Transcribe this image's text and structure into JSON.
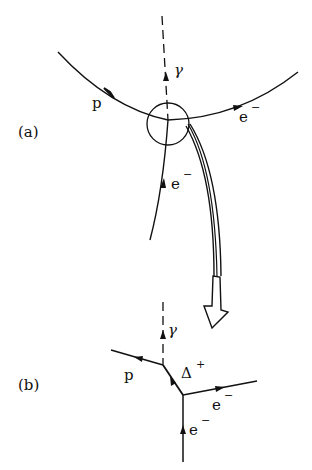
{
  "diagram": {
    "panel_a": {
      "label": "(a)",
      "particles": {
        "proton": "p",
        "photon": "γ",
        "electron_out": "e",
        "electron_out_sup": "−",
        "electron_in": "e",
        "electron_in_sup": "−"
      }
    },
    "panel_b": {
      "label": "(b)",
      "particles": {
        "proton": "p",
        "photon": "γ",
        "delta": "Δ",
        "delta_sup": "+",
        "electron_out": "e",
        "electron_out_sup": "−",
        "electron_in": "e",
        "electron_in_sup": "−"
      }
    },
    "colors": {
      "ink": "#111111",
      "background": "#ffffff"
    }
  }
}
